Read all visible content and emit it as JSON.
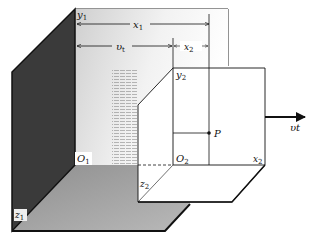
{
  "figure": {
    "labels": {
      "y1": {
        "base": "y",
        "sub": "1"
      },
      "x1": {
        "base": "x",
        "sub": "1"
      },
      "vt": {
        "base": "υ",
        "sub": "t"
      },
      "x2_top": {
        "base": "x",
        "sub": "2"
      },
      "y2": {
        "base": "y",
        "sub": "2"
      },
      "P": "P",
      "O1": {
        "base": "O",
        "sub": "1"
      },
      "O2": {
        "base": "O",
        "sub": "2"
      },
      "x2_axis": {
        "base": "x",
        "sub": "2"
      },
      "z2": {
        "base": "z",
        "sub": "2"
      },
      "z1": {
        "base": "z",
        "sub": "1"
      },
      "velocity": "υt"
    },
    "colors": {
      "line": "#111111",
      "dark_wall": "#3a3a3a",
      "light_wall": "#d9d9d9",
      "floor": "#a8a8a8",
      "background": "#ffffff"
    }
  }
}
